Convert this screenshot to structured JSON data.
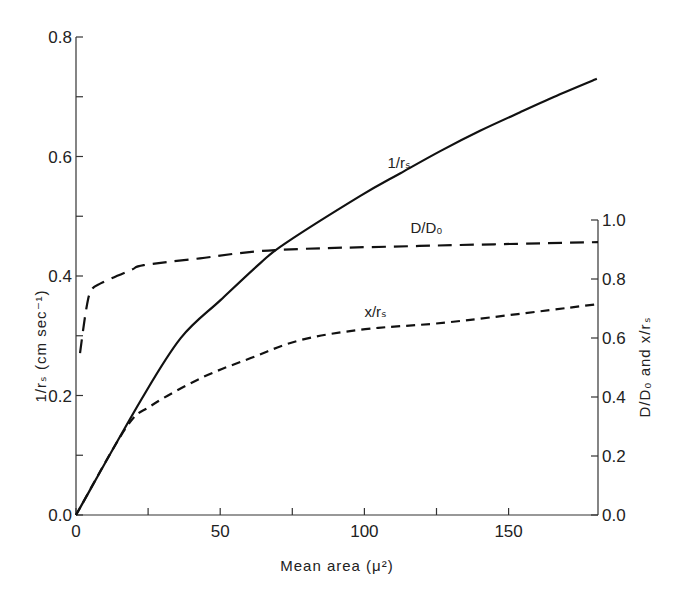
{
  "chart_data": {
    "type": "line",
    "title": "",
    "xlabel": "Mean area (μ²)",
    "ylabel_left": "1/rₛ (cm sec⁻¹)",
    "ylabel_right": "D/D₀ and x/rₛ",
    "xlim": [
      0,
      181
    ],
    "ylim_left": [
      0,
      0.8
    ],
    "ylim_right": [
      0,
      1.0
    ],
    "x_ticks": [
      0,
      50,
      100,
      150
    ],
    "x_tick_labels": [
      "0",
      "50",
      "100",
      "150"
    ],
    "x_minor_ticks": [
      25,
      75,
      125
    ],
    "y_left_ticks": [
      0.0,
      0.2,
      0.4,
      0.6,
      0.8
    ],
    "y_left_tick_labels": [
      "0.0",
      "0.2",
      "0.4",
      "0.6",
      "0.8"
    ],
    "y_left_minor_ticks": [
      0.1,
      0.3,
      0.5,
      0.7
    ],
    "y_right_ticks": [
      0.0,
      0.2,
      0.4,
      0.6,
      0.8,
      1.0
    ],
    "y_right_tick_labels": [
      "0.0",
      "0.2",
      "0.4",
      "0.6",
      "0.8",
      "1.0"
    ],
    "grid": false,
    "legend": "none (inline curve labels)",
    "series": [
      {
        "name": "1/rₛ",
        "axis": "left",
        "style": "solid",
        "label_pos": [
          108,
          0.58
        ],
        "x": [
          0,
          22.5,
          36.3,
          50.2,
          64.0,
          72.7,
          98.6,
          112.5,
          126.3,
          140.1,
          154.0,
          167.8,
          180.6
        ],
        "y": [
          0,
          0.192,
          0.296,
          0.36,
          0.422,
          0.455,
          0.534,
          0.572,
          0.609,
          0.643,
          0.674,
          0.704,
          0.73
        ]
      },
      {
        "name": "D/D₀",
        "axis": "right",
        "style": "long-dash",
        "label_pos": [
          116,
          0.955
        ],
        "x": [
          1.4,
          3.5,
          5.2,
          8.7,
          19.0,
          23.5,
          43.0,
          69.0,
          119.0,
          181.0
        ],
        "y": [
          0.549,
          0.695,
          0.76,
          0.786,
          0.83,
          0.847,
          0.87,
          0.898,
          0.912,
          0.925
        ]
      },
      {
        "name": "x/rₛ",
        "axis": "right",
        "style": "short-dash",
        "label_pos": [
          100,
          0.67
        ],
        "x": [
          0,
          17.3,
          26.0,
          43.3,
          60.6,
          77.9,
          100.3,
          129.8,
          181.0
        ],
        "y": [
          0,
          0.295,
          0.37,
          0.464,
          0.532,
          0.593,
          0.63,
          0.654,
          0.715
        ]
      }
    ]
  }
}
